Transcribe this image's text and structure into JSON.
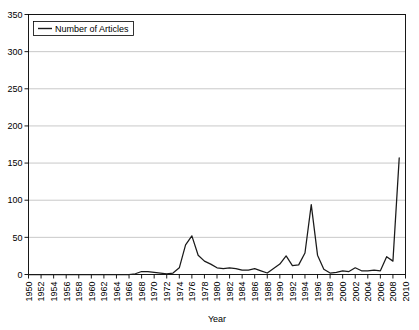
{
  "chart_data": {
    "type": "line",
    "title": "",
    "xlabel": "Year",
    "ylabel": "",
    "xlim": [
      1950,
      2010
    ],
    "ylim": [
      0,
      350
    ],
    "grid": true,
    "legend_position": "top-left",
    "legend_entries": [
      "Number of Articles"
    ],
    "y_ticks": [
      0,
      50,
      100,
      150,
      200,
      250,
      300,
      350
    ],
    "x_ticks": [
      1950,
      1952,
      1954,
      1956,
      1958,
      1960,
      1962,
      1964,
      1966,
      1968,
      1970,
      1972,
      1974,
      1976,
      1978,
      1980,
      1982,
      1984,
      1986,
      1988,
      1990,
      1992,
      1994,
      1996,
      1998,
      2000,
      2002,
      2004,
      2006,
      2008,
      2010
    ],
    "series": [
      {
        "name": "Number of Articles",
        "color": "#1a1a1a",
        "x": [
          1950,
          1951,
          1952,
          1953,
          1954,
          1955,
          1956,
          1957,
          1958,
          1959,
          1960,
          1961,
          1962,
          1963,
          1964,
          1965,
          1966,
          1967,
          1968,
          1969,
          1970,
          1971,
          1972,
          1973,
          1974,
          1975,
          1976,
          1977,
          1978,
          1979,
          1980,
          1981,
          1982,
          1983,
          1984,
          1985,
          1986,
          1987,
          1988,
          1989,
          1990,
          1991,
          1992,
          1993,
          1994,
          1995,
          1996,
          1997,
          1998,
          1999,
          2000,
          2001,
          2002,
          2003,
          2004,
          2005,
          2006,
          2007,
          2008,
          2009
        ],
        "values": [
          0,
          0,
          0,
          0,
          0,
          0,
          0,
          0,
          0,
          0,
          0,
          0,
          0,
          0,
          0,
          0,
          0,
          1,
          4,
          4,
          3,
          2,
          1,
          2,
          9,
          40,
          52,
          26,
          18,
          14,
          9,
          8,
          9,
          8,
          6,
          6,
          8,
          5,
          2,
          8,
          14,
          25,
          12,
          13,
          29,
          94,
          26,
          7,
          2,
          3,
          5,
          4,
          9,
          5,
          5,
          6,
          5,
          24,
          18,
          157
        ]
      }
    ]
  },
  "legend": {
    "label": "Number of Articles"
  },
  "axes": {
    "x_title": "Year"
  }
}
